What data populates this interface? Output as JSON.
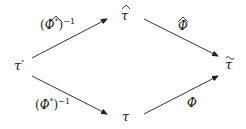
{
  "diagram": {
    "type": "commutative-diagram",
    "nodes": {
      "left": {
        "id": "tau_prime",
        "base": "τ",
        "mark": "′"
      },
      "top": {
        "id": "tau_hat",
        "base": "τ",
        "accent": "hat"
      },
      "right": {
        "id": "tau_tilde",
        "base": "τ",
        "accent": "tilde"
      },
      "bottom": {
        "id": "tau",
        "base": "τ"
      }
    },
    "edges": [
      {
        "from": "tau_prime",
        "to": "tau_hat",
        "label": {
          "open": "(",
          "base": "Φ",
          "accent": "hat",
          "star": "*",
          "close": ")",
          "power": "−1"
        }
      },
      {
        "from": "tau_hat",
        "to": "tau_tilde",
        "label": {
          "base": "Φ",
          "accent": "hat"
        }
      },
      {
        "from": "tau_prime",
        "to": "tau",
        "label": {
          "open": "(",
          "base": "Φ",
          "star": "*",
          "close": ")",
          "power": "−1"
        }
      },
      {
        "from": "tau",
        "to": "tau_tilde",
        "label": {
          "base": "Φ"
        }
      }
    ],
    "colors": {
      "ink": "#222222",
      "background": "#ffffff"
    }
  }
}
